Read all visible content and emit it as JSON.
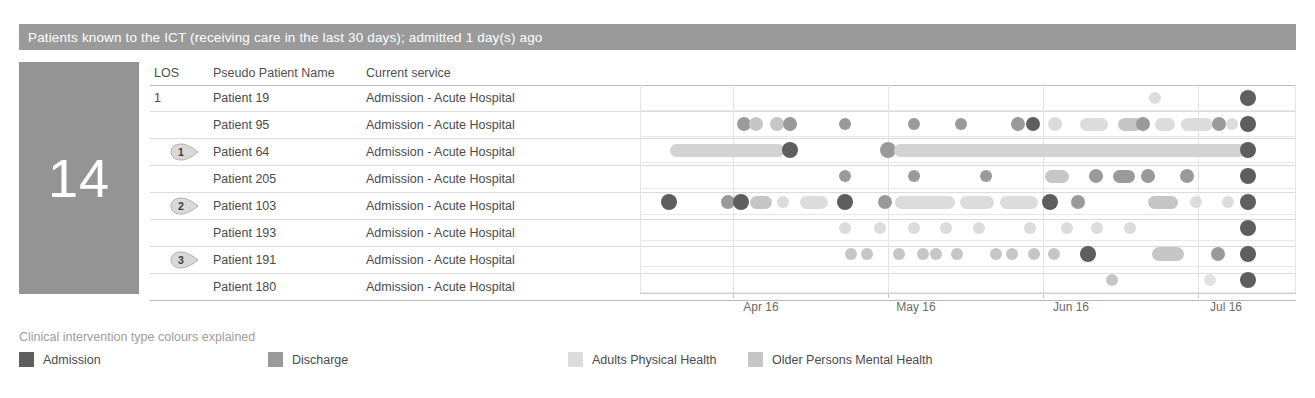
{
  "header": {
    "title": "Patients known to the ICT (receiving care in the last 30 days); admitted 1 day(s) ago",
    "bar_color": "#9a9a9a"
  },
  "kpi": {
    "value": "14",
    "panel_color": "#949494"
  },
  "table": {
    "columns": [
      "LOS",
      "Pseudo Patient Name",
      "Current service"
    ],
    "rows": [
      {
        "los": "1",
        "badge": "",
        "name": "Patient 19",
        "service": "Admission - Acute Hospital"
      },
      {
        "los": "",
        "badge": "",
        "name": "Patient 95",
        "service": "Admission - Acute Hospital"
      },
      {
        "los": "",
        "badge": "1",
        "name": "Patient 64",
        "service": "Admission - Acute Hospital"
      },
      {
        "los": "",
        "badge": "",
        "name": "Patient 205",
        "service": "Admission - Acute Hospital"
      },
      {
        "los": "",
        "badge": "2",
        "name": "Patient 103",
        "service": "Admission - Acute Hospital"
      },
      {
        "los": "",
        "badge": "",
        "name": "Patient 193",
        "service": "Admission - Acute Hospital"
      },
      {
        "los": "",
        "badge": "3",
        "name": "Patient 191",
        "service": "Admission - Acute Hospital"
      },
      {
        "los": "",
        "badge": "",
        "name": "Patient 180",
        "service": "Admission - Acute Hospital"
      }
    ]
  },
  "legend": {
    "title": "Clinical intervention type colours explained",
    "items": [
      {
        "label": "Admission",
        "color": "#5e5e5e",
        "x": 0
      },
      {
        "label": "Discharge",
        "color": "#9a9a9a",
        "x": 249
      },
      {
        "label": "Adults Physical Health",
        "color": "#dcdcdc",
        "x": 549
      },
      {
        "label": "Older Persons Mental Health",
        "color": "#c6c6c6",
        "x": 729
      }
    ]
  },
  "chart_data": {
    "type": "timeline",
    "xlabel": "",
    "ylabel": "",
    "grid": "vertical",
    "legend_position": "bottom",
    "axis_ticks": [
      {
        "label": "Apr 16",
        "x": 93
      },
      {
        "label": "May 16",
        "x": 248
      },
      {
        "label": "Jun 16",
        "x": 403
      },
      {
        "label": "Jul 16",
        "x": 558
      }
    ],
    "xlim_px": [
      0,
      656
    ],
    "colors": {
      "admission": "#5e5e5e",
      "discharge": "#9a9a9a",
      "adults_physical_health": "#dcdcdc",
      "older_persons_mental_health": "#c6c6c6"
    },
    "series": [
      {
        "name": "Patient 19",
        "marks": [
          {
            "type": "dot",
            "x": 515,
            "r": 6,
            "color": "#dcdcdc"
          },
          {
            "type": "dot",
            "x": 608,
            "r": 8,
            "color": "#5e5e5e"
          }
        ]
      },
      {
        "name": "Patient 95",
        "marks": [
          {
            "type": "dot",
            "x": 104,
            "r": 7,
            "color": "#9a9a9a"
          },
          {
            "type": "dot",
            "x": 116,
            "r": 7,
            "color": "#c6c6c6"
          },
          {
            "type": "dot",
            "x": 137,
            "r": 7,
            "color": "#c6c6c6"
          },
          {
            "type": "dot",
            "x": 150,
            "r": 7,
            "color": "#9a9a9a"
          },
          {
            "type": "dot",
            "x": 205,
            "r": 6,
            "color": "#9a9a9a"
          },
          {
            "type": "dot",
            "x": 274,
            "r": 6,
            "color": "#9a9a9a"
          },
          {
            "type": "dot",
            "x": 321,
            "r": 6,
            "color": "#9a9a9a"
          },
          {
            "type": "dot",
            "x": 378,
            "r": 7,
            "color": "#9a9a9a"
          },
          {
            "type": "dot",
            "x": 393,
            "r": 7,
            "color": "#5e5e5e"
          },
          {
            "type": "dot",
            "x": 415,
            "r": 7,
            "color": "#dcdcdc"
          },
          {
            "type": "bar",
            "x": 440,
            "w": 28,
            "h": 13,
            "color": "#dcdcdc"
          },
          {
            "type": "bar",
            "x": 478,
            "w": 24,
            "h": 13,
            "color": "#c6c6c6"
          },
          {
            "type": "dot",
            "x": 503,
            "r": 7,
            "color": "#9a9a9a"
          },
          {
            "type": "bar",
            "x": 515,
            "w": 20,
            "h": 13,
            "color": "#dcdcdc"
          },
          {
            "type": "bar",
            "x": 541,
            "w": 32,
            "h": 13,
            "color": "#dcdcdc"
          },
          {
            "type": "dot",
            "x": 579,
            "r": 7,
            "color": "#9a9a9a"
          },
          {
            "type": "dot",
            "x": 592,
            "r": 6,
            "color": "#dcdcdc"
          },
          {
            "type": "dot",
            "x": 608,
            "r": 8,
            "color": "#5e5e5e"
          }
        ]
      },
      {
        "name": "Patient 64",
        "marks": [
          {
            "type": "bar",
            "x": 30,
            "w": 115,
            "h": 13,
            "color": "#d3d3d3"
          },
          {
            "type": "dot",
            "x": 150,
            "r": 8,
            "color": "#5e5e5e"
          },
          {
            "type": "dot",
            "x": 248,
            "r": 8,
            "color": "#9a9a9a"
          },
          {
            "type": "bar",
            "x": 254,
            "w": 352,
            "h": 13,
            "color": "#d3d3d3"
          },
          {
            "type": "dot",
            "x": 608,
            "r": 8,
            "color": "#5e5e5e"
          }
        ]
      },
      {
        "name": "Patient 205",
        "marks": [
          {
            "type": "dot",
            "x": 205,
            "r": 6,
            "color": "#9a9a9a"
          },
          {
            "type": "dot",
            "x": 274,
            "r": 6,
            "color": "#9a9a9a"
          },
          {
            "type": "dot",
            "x": 346,
            "r": 6,
            "color": "#9a9a9a"
          },
          {
            "type": "bar",
            "x": 405,
            "w": 24,
            "h": 13,
            "color": "#c6c6c6"
          },
          {
            "type": "dot",
            "x": 456,
            "r": 7,
            "color": "#9a9a9a"
          },
          {
            "type": "bar",
            "x": 473,
            "w": 22,
            "h": 13,
            "color": "#9a9a9a"
          },
          {
            "type": "dot",
            "x": 508,
            "r": 7,
            "color": "#9a9a9a"
          },
          {
            "type": "dot",
            "x": 547,
            "r": 7,
            "color": "#9a9a9a"
          },
          {
            "type": "dot",
            "x": 608,
            "r": 8,
            "color": "#5e5e5e"
          }
        ]
      },
      {
        "name": "Patient 103",
        "marks": [
          {
            "type": "dot",
            "x": 29,
            "r": 8,
            "color": "#5e5e5e"
          },
          {
            "type": "dot",
            "x": 88,
            "r": 7,
            "color": "#9a9a9a"
          },
          {
            "type": "dot",
            "x": 101,
            "r": 8,
            "color": "#5e5e5e"
          },
          {
            "type": "bar",
            "x": 110,
            "w": 22,
            "h": 13,
            "color": "#c6c6c6"
          },
          {
            "type": "dot",
            "x": 143,
            "r": 6,
            "color": "#dcdcdc"
          },
          {
            "type": "bar",
            "x": 160,
            "w": 28,
            "h": 13,
            "color": "#dcdcdc"
          },
          {
            "type": "dot",
            "x": 205,
            "r": 8,
            "color": "#5e5e5e"
          },
          {
            "type": "dot",
            "x": 245,
            "r": 7,
            "color": "#9a9a9a"
          },
          {
            "type": "bar",
            "x": 255,
            "w": 60,
            "h": 13,
            "color": "#dcdcdc"
          },
          {
            "type": "bar",
            "x": 320,
            "w": 34,
            "h": 13,
            "color": "#dcdcdc"
          },
          {
            "type": "bar",
            "x": 360,
            "w": 38,
            "h": 13,
            "color": "#dcdcdc"
          },
          {
            "type": "dot",
            "x": 410,
            "r": 8,
            "color": "#5e5e5e"
          },
          {
            "type": "dot",
            "x": 438,
            "r": 7,
            "color": "#9a9a9a"
          },
          {
            "type": "bar",
            "x": 508,
            "w": 30,
            "h": 13,
            "color": "#c6c6c6"
          },
          {
            "type": "dot",
            "x": 556,
            "r": 6,
            "color": "#dcdcdc"
          },
          {
            "type": "dot",
            "x": 588,
            "r": 6,
            "color": "#dcdcdc"
          },
          {
            "type": "dot",
            "x": 608,
            "r": 8,
            "color": "#5e5e5e"
          }
        ]
      },
      {
        "name": "Patient 193",
        "marks": [
          {
            "type": "dot",
            "x": 205,
            "r": 6,
            "color": "#dcdcdc"
          },
          {
            "type": "dot",
            "x": 240,
            "r": 6,
            "color": "#dcdcdc"
          },
          {
            "type": "dot",
            "x": 274,
            "r": 6,
            "color": "#dcdcdc"
          },
          {
            "type": "dot",
            "x": 306,
            "r": 6,
            "color": "#dcdcdc"
          },
          {
            "type": "dot",
            "x": 339,
            "r": 6,
            "color": "#dcdcdc"
          },
          {
            "type": "dot",
            "x": 390,
            "r": 6,
            "color": "#dcdcdc"
          },
          {
            "type": "dot",
            "x": 427,
            "r": 6,
            "color": "#dcdcdc"
          },
          {
            "type": "dot",
            "x": 457,
            "r": 6,
            "color": "#dcdcdc"
          },
          {
            "type": "dot",
            "x": 490,
            "r": 6,
            "color": "#dcdcdc"
          },
          {
            "type": "dot",
            "x": 608,
            "r": 8,
            "color": "#5e5e5e"
          }
        ]
      },
      {
        "name": "Patient 191",
        "marks": [
          {
            "type": "dot",
            "x": 211,
            "r": 6,
            "color": "#c6c6c6"
          },
          {
            "type": "dot",
            "x": 227,
            "r": 6,
            "color": "#c6c6c6"
          },
          {
            "type": "dot",
            "x": 259,
            "r": 6,
            "color": "#c6c6c6"
          },
          {
            "type": "dot",
            "x": 283,
            "r": 6,
            "color": "#c6c6c6"
          },
          {
            "type": "dot",
            "x": 296,
            "r": 6,
            "color": "#c6c6c6"
          },
          {
            "type": "dot",
            "x": 317,
            "r": 6,
            "color": "#c6c6c6"
          },
          {
            "type": "dot",
            "x": 356,
            "r": 6,
            "color": "#c6c6c6"
          },
          {
            "type": "dot",
            "x": 372,
            "r": 6,
            "color": "#c6c6c6"
          },
          {
            "type": "dot",
            "x": 394,
            "r": 6,
            "color": "#c6c6c6"
          },
          {
            "type": "dot",
            "x": 414,
            "r": 6,
            "color": "#c6c6c6"
          },
          {
            "type": "dot",
            "x": 448,
            "r": 8,
            "color": "#5e5e5e"
          },
          {
            "type": "bar",
            "x": 512,
            "w": 32,
            "h": 14,
            "color": "#c6c6c6"
          },
          {
            "type": "dot",
            "x": 578,
            "r": 7,
            "color": "#9a9a9a"
          },
          {
            "type": "dot",
            "x": 608,
            "r": 8,
            "color": "#5e5e5e"
          }
        ]
      },
      {
        "name": "Patient 180",
        "marks": [
          {
            "type": "dot",
            "x": 472,
            "r": 6,
            "color": "#c6c6c6"
          },
          {
            "type": "dot",
            "x": 570,
            "r": 6,
            "color": "#e2e2e2"
          },
          {
            "type": "dot",
            "x": 608,
            "r": 8,
            "color": "#5e5e5e"
          }
        ]
      }
    ]
  }
}
